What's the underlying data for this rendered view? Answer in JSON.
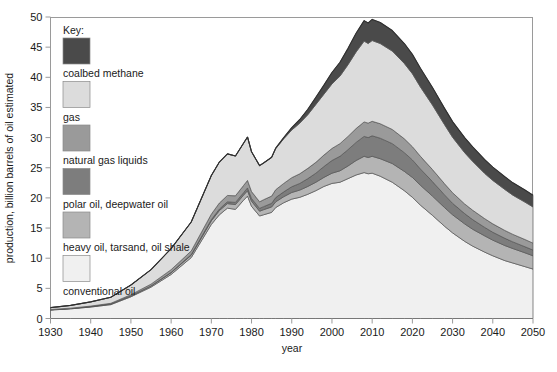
{
  "figure": {
    "background": "#ffffff",
    "plot_border_color": "#999999"
  },
  "axes": {
    "y_axis_title": "production, billion barrels of oil estimated",
    "x_axis_title": "year",
    "y_ticks": [
      "0",
      "5",
      "10",
      "15",
      "20",
      "25",
      "30",
      "35",
      "40",
      "45",
      "50"
    ],
    "x_ticks": [
      "1930",
      "1940",
      "1950",
      "1960",
      "1970",
      "1980",
      "1990",
      "2000",
      "2010",
      "2020",
      "2030",
      "2040",
      "2050"
    ]
  },
  "legend": {
    "title": "Key:",
    "items": [
      {
        "label": "coalbed methane",
        "color": "#4a4a4a"
      },
      {
        "label": "gas",
        "color": "#dcdcdc"
      },
      {
        "label": "natural gas liquids",
        "color": "#9a9a9a"
      },
      {
        "label": "polar oil, deepwater oil",
        "color": "#7d7d7d"
      },
      {
        "label": "heavy oil, tarsand, oil shale",
        "color": "#b4b4b4"
      },
      {
        "label": "conventional oil",
        "color": "#f0f0f0"
      }
    ]
  },
  "chart_data": {
    "type": "area",
    "stacked": true,
    "title": "",
    "subtitle": "",
    "xlabel": "year",
    "ylabel": "production, billion barrels of oil estimated",
    "xlim": [
      1930,
      2050
    ],
    "ylim": [
      0,
      50
    ],
    "grid": false,
    "legend_position": "inside-upper-left",
    "x": [
      1930,
      1935,
      1940,
      1945,
      1950,
      1955,
      1960,
      1965,
      1970,
      1972,
      1974,
      1976,
      1978,
      1979,
      1980,
      1982,
      1983,
      1985,
      1986,
      1988,
      1990,
      1992,
      1994,
      1996,
      1998,
      2000,
      2002,
      2004,
      2006,
      2008,
      2009,
      2010,
      2012,
      2015,
      2018,
      2020,
      2022,
      2025,
      2028,
      2030,
      2033,
      2035,
      2038,
      2040,
      2043,
      2045,
      2048,
      2050
    ],
    "series": [
      {
        "name": "conventional oil",
        "color": "#f0f0f0",
        "values": [
          1.4,
          1.6,
          1.9,
          2.3,
          3.6,
          5.2,
          7.3,
          10.1,
          15.6,
          17.2,
          18.3,
          18.1,
          19.6,
          20.3,
          18.6,
          17.0,
          17.2,
          17.6,
          18.4,
          19.2,
          19.8,
          20.1,
          20.6,
          21.2,
          21.9,
          22.4,
          22.6,
          23.2,
          23.8,
          24.2,
          24.0,
          24.1,
          23.6,
          22.6,
          21.2,
          20.1,
          18.8,
          17.1,
          15.3,
          14.2,
          12.8,
          12.0,
          11.0,
          10.4,
          9.6,
          9.2,
          8.6,
          8.2
        ]
      },
      {
        "name": "heavy oil, tarsand, oil shale",
        "color": "#b4b4b4",
        "values": [
          0.05,
          0.06,
          0.08,
          0.1,
          0.15,
          0.2,
          0.3,
          0.4,
          0.6,
          0.7,
          0.75,
          0.8,
          0.85,
          0.9,
          0.85,
          0.8,
          0.85,
          0.9,
          0.95,
          1.0,
          1.1,
          1.2,
          1.3,
          1.4,
          1.5,
          1.7,
          1.9,
          2.1,
          2.4,
          2.7,
          2.7,
          2.8,
          2.9,
          3.1,
          3.2,
          3.3,
          3.3,
          3.2,
          3.1,
          3.0,
          2.9,
          2.8,
          2.7,
          2.6,
          2.5,
          2.4,
          2.3,
          2.2
        ]
      },
      {
        "name": "polar oil, deepwater oil",
        "color": "#7d7d7d",
        "values": [
          0.0,
          0.0,
          0.0,
          0.0,
          0.0,
          0.0,
          0.05,
          0.1,
          0.2,
          0.25,
          0.3,
          0.35,
          0.4,
          0.45,
          0.45,
          0.45,
          0.5,
          0.6,
          0.7,
          0.8,
          0.95,
          1.1,
          1.3,
          1.5,
          1.8,
          2.1,
          2.4,
          2.7,
          3.0,
          3.3,
          3.3,
          3.4,
          3.4,
          3.3,
          3.1,
          2.9,
          2.7,
          2.4,
          2.1,
          1.9,
          1.7,
          1.6,
          1.4,
          1.3,
          1.2,
          1.1,
          1.0,
          0.95
        ]
      },
      {
        "name": "natural gas liquids",
        "color": "#9a9a9a",
        "values": [
          0.05,
          0.06,
          0.08,
          0.12,
          0.2,
          0.3,
          0.45,
          0.6,
          0.9,
          1.0,
          1.05,
          1.1,
          1.2,
          1.25,
          1.15,
          1.1,
          1.15,
          1.2,
          1.3,
          1.4,
          1.5,
          1.6,
          1.7,
          1.8,
          1.9,
          2.0,
          2.1,
          2.2,
          2.3,
          2.4,
          2.4,
          2.4,
          2.4,
          2.35,
          2.3,
          2.2,
          2.1,
          2.0,
          1.85,
          1.75,
          1.6,
          1.55,
          1.45,
          1.4,
          1.3,
          1.25,
          1.2,
          1.15
        ]
      },
      {
        "name": "gas",
        "color": "#dcdcdc",
        "values": [
          0.3,
          0.45,
          0.7,
          1.0,
          1.6,
          2.4,
          3.5,
          4.8,
          6.4,
          6.8,
          6.9,
          6.6,
          7.0,
          7.2,
          6.6,
          6.0,
          6.1,
          6.4,
          6.8,
          7.4,
          7.9,
          8.4,
          8.9,
          9.6,
          10.1,
          10.7,
          11.2,
          11.9,
          12.7,
          13.4,
          13.2,
          13.4,
          13.3,
          13.0,
          12.5,
          12.1,
          11.5,
          10.7,
          9.8,
          9.2,
          8.5,
          8.1,
          7.5,
          7.2,
          6.8,
          6.5,
          6.2,
          6.0
        ]
      },
      {
        "name": "coalbed methane",
        "color": "#4a4a4a",
        "values": [
          0.0,
          0.0,
          0.0,
          0.0,
          0.0,
          0.0,
          0.0,
          0.0,
          0.0,
          0.0,
          0.0,
          0.0,
          0.0,
          0.0,
          0.0,
          0.0,
          0.0,
          0.05,
          0.1,
          0.2,
          0.4,
          0.6,
          0.9,
          1.2,
          1.5,
          1.9,
          2.3,
          2.7,
          3.1,
          3.4,
          3.4,
          3.5,
          3.5,
          3.4,
          3.3,
          3.2,
          3.1,
          2.9,
          2.7,
          2.6,
          2.5,
          2.4,
          2.3,
          2.2,
          2.1,
          2.05,
          2.0,
          1.95
        ]
      }
    ]
  }
}
